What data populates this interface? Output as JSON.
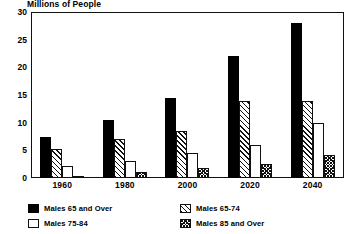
{
  "chart_data": {
    "type": "bar",
    "title": "Millions of People",
    "xlabel": "",
    "ylabel": "",
    "ylim": [
      0,
      30
    ],
    "yticks": [
      0,
      5,
      10,
      15,
      20,
      25,
      30
    ],
    "grid": false,
    "legend_position": "bottom",
    "categories": [
      "1960",
      "1980",
      "2000",
      "2020",
      "2040"
    ],
    "series": [
      {
        "name": "Males 65 and Over",
        "pattern": "solid-black",
        "values": [
          7.5,
          10.5,
          14.5,
          22.0,
          28.0
        ]
      },
      {
        "name": "Males 65-74",
        "pattern": "diagonal-hatch",
        "values": [
          5.2,
          7.0,
          8.5,
          14.0,
          14.0
        ]
      },
      {
        "name": "Males 75-84",
        "pattern": "open-white",
        "values": [
          2.2,
          3.0,
          4.5,
          6.0,
          10.0
        ]
      },
      {
        "name": "Males 85 and Over",
        "pattern": "dense-crosshatch",
        "values": [
          0.3,
          1.0,
          1.8,
          2.5,
          4.2
        ]
      }
    ]
  },
  "legend": {
    "items": [
      {
        "label": "Males 65 and Over",
        "pattern": "solid-black"
      },
      {
        "label": "Males 65-74",
        "pattern": "diagonal-hatch"
      },
      {
        "label": "Males 75-84",
        "pattern": "open-white"
      },
      {
        "label": "Males 85 and Over",
        "pattern": "dense-crosshatch"
      }
    ]
  },
  "colors": {
    "ink": "#111111",
    "background": "#ffffff",
    "solid": "#000000"
  }
}
